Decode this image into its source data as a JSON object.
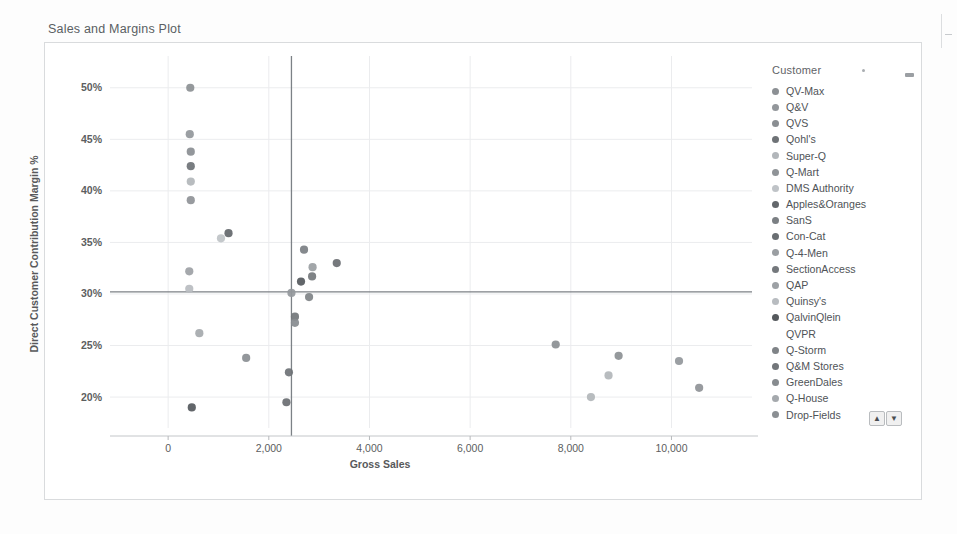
{
  "object": {
    "title": "Sales and Margins Plot",
    "menu_icon": "kebab-menu-icon"
  },
  "legend": {
    "title": "Customer",
    "scroll_up_label": "▲",
    "scroll_down_label": "▼",
    "items": [
      {
        "label": "QV-Max",
        "color": "#8c9094"
      },
      {
        "label": "Q&V",
        "color": "#93979b"
      },
      {
        "label": "QVS",
        "color": "#8a8e92"
      },
      {
        "label": "Qohl's",
        "color": "#6e7276"
      },
      {
        "label": "Super-Q",
        "color": "#b2b6ba"
      },
      {
        "label": "Q-Mart",
        "color": "#8f9397"
      },
      {
        "label": "DMS Authority",
        "color": "#bfc3c7"
      },
      {
        "label": "Apples&Oranges",
        "color": "#63676b"
      },
      {
        "label": "SanS",
        "color": "#7b7f83"
      },
      {
        "label": "Con-Cat",
        "color": "#6a6e72"
      },
      {
        "label": "Q-4-Men",
        "color": "#9a9ea2"
      },
      {
        "label": "SectionAccess",
        "color": "#74787c"
      },
      {
        "label": "QAP",
        "color": "#9da1a5"
      },
      {
        "label": "Quinsy's",
        "color": "#b8bcc0"
      },
      {
        "label": "QalvinQlein",
        "color": "#55595d"
      },
      {
        "label": "QVPR",
        "color": "#9498 9c"
      },
      {
        "label": "Q-Storm",
        "color": "#7f8387"
      },
      {
        "label": "Q&M Stores",
        "color": "#72767a"
      },
      {
        "label": "GreenDales",
        "color": "#878b8f"
      },
      {
        "label": "Q-House",
        "color": "#a5a9ad"
      },
      {
        "label": "Drop-Fields",
        "color": "#8b8f93"
      }
    ]
  },
  "chart_data": {
    "type": "scatter",
    "title": "Sales and Margins Plot",
    "xlabel": "Gross Sales",
    "ylabel": "Direct Customer Contribution Margin %",
    "xlim": [
      -400,
      11600
    ],
    "ylim": [
      17.0,
      52.5
    ],
    "xticks": [
      0,
      2000,
      4000,
      6000,
      8000,
      10000
    ],
    "xticklabels": [
      "0",
      "2,000",
      "4,000",
      "6,000",
      "8,000",
      "10,000"
    ],
    "yticks": [
      20,
      25,
      30,
      35,
      40,
      45,
      50
    ],
    "yticklabels": [
      "20%",
      "25%",
      "30%",
      "35%",
      "40%",
      "45%",
      "50%"
    ],
    "grid": true,
    "legend_position": "right",
    "reference_lines": [
      {
        "orientation": "horizontal",
        "value": 30.2,
        "label": "average margin"
      },
      {
        "orientation": "vertical",
        "value": 2450,
        "label": "average gross sales"
      }
    ],
    "points": [
      {
        "label": "QV-Max",
        "x": 440,
        "y": 50.0,
        "color": "#8c9094"
      },
      {
        "label": "Q&V",
        "x": 430,
        "y": 45.5,
        "color": "#93979b"
      },
      {
        "label": "QVS",
        "x": 450,
        "y": 43.8,
        "color": "#8a8e92"
      },
      {
        "label": "Qohl's",
        "x": 450,
        "y": 42.4,
        "color": "#6e7276"
      },
      {
        "label": "Super-Q",
        "x": 450,
        "y": 40.9,
        "color": "#b2b6ba"
      },
      {
        "label": "Q-Mart",
        "x": 450,
        "y": 39.1,
        "color": "#8f9397"
      },
      {
        "label": "DMS Authority",
        "x": 1050,
        "y": 35.4,
        "color": "#bfc3c7"
      },
      {
        "label": "Apples&Oranges",
        "x": 1200,
        "y": 35.9,
        "color": "#63676b"
      },
      {
        "label": "SanS",
        "x": 2700,
        "y": 34.3,
        "color": "#7b7f83"
      },
      {
        "label": "Con-Cat",
        "x": 3350,
        "y": 33.0,
        "color": "#6a6e72"
      },
      {
        "label": "Q-4-Men",
        "x": 2870,
        "y": 32.6,
        "color": "#9a9ea2"
      },
      {
        "label": "SectionAccess",
        "x": 2860,
        "y": 31.7,
        "color": "#74787c"
      },
      {
        "label": "QAP",
        "x": 420,
        "y": 32.2,
        "color": "#9da1a5"
      },
      {
        "label": "Quinsy's",
        "x": 420,
        "y": 30.5,
        "color": "#b8bcc0"
      },
      {
        "label": "QalvinQlein",
        "x": 2640,
        "y": 31.2,
        "color": "#55595d"
      },
      {
        "label": "QVPR",
        "x": 2450,
        "y": 30.1,
        "color": "#94989c"
      },
      {
        "label": "Q-Storm",
        "x": 2800,
        "y": 29.7,
        "color": "#7f8387"
      },
      {
        "label": "Q&M Stores",
        "x": 2520,
        "y": 27.8,
        "color": "#72767a"
      },
      {
        "label": "GreenDales",
        "x": 2520,
        "y": 27.2,
        "color": "#878b8f"
      },
      {
        "label": "Q-House",
        "x": 620,
        "y": 26.2,
        "color": "#a5a9ad"
      },
      {
        "label": "Drop-Fields",
        "x": 7700,
        "y": 25.1,
        "color": "#8b8f93"
      },
      {
        "label": "QV-Max",
        "x": 8950,
        "y": 24.0,
        "color": "#8c9094"
      },
      {
        "label": "Q&V",
        "x": 10150,
        "y": 23.5,
        "color": "#93979b"
      },
      {
        "label": "QVS",
        "x": 1550,
        "y": 23.8,
        "color": "#8a8e92"
      },
      {
        "label": "Qohl's",
        "x": 2400,
        "y": 22.4,
        "color": "#6e7276"
      },
      {
        "label": "Super-Q",
        "x": 8750,
        "y": 22.1,
        "color": "#b2b6ba"
      },
      {
        "label": "Q-Mart",
        "x": 10550,
        "y": 20.9,
        "color": "#8f9397"
      },
      {
        "label": "SanS",
        "x": 8400,
        "y": 20.0,
        "color": "#b2b6ba"
      },
      {
        "label": "Con-Cat",
        "x": 2350,
        "y": 19.5,
        "color": "#6a6e72"
      },
      {
        "label": "QAP",
        "x": 470,
        "y": 19.0,
        "color": "#55595d"
      }
    ]
  }
}
